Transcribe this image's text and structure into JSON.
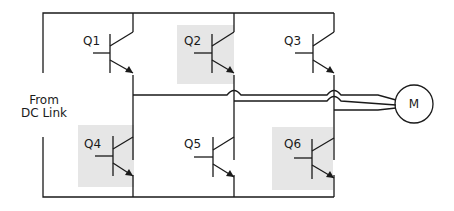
{
  "diagram": {
    "type": "three-phase inverter bridge driving motor",
    "source_label_line1": "From",
    "source_label_line2": "DC Link",
    "motor_label": "M",
    "colors": {
      "line": "#1a1a1a",
      "highlight": "#e6e6e6",
      "background": "#ffffff"
    },
    "transistors": [
      {
        "id": "Q1",
        "label": "Q1",
        "position": "upper",
        "leg": 1,
        "highlighted": false
      },
      {
        "id": "Q2",
        "label": "Q2",
        "position": "upper",
        "leg": 2,
        "highlighted": true
      },
      {
        "id": "Q3",
        "label": "Q3",
        "position": "upper",
        "leg": 3,
        "highlighted": false
      },
      {
        "id": "Q4",
        "label": "Q4",
        "position": "lower",
        "leg": 1,
        "highlighted": true
      },
      {
        "id": "Q5",
        "label": "Q5",
        "position": "lower",
        "leg": 2,
        "highlighted": false
      },
      {
        "id": "Q6",
        "label": "Q6",
        "position": "lower",
        "leg": 3,
        "highlighted": true
      }
    ]
  }
}
